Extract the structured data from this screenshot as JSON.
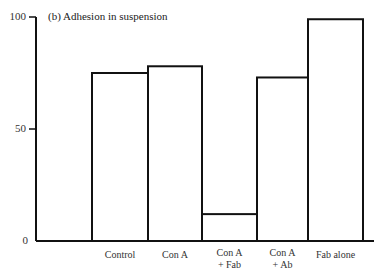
{
  "chart_data": {
    "type": "bar",
    "title": "(b)  Adhesion in suspension",
    "xlabel": "",
    "ylabel": "",
    "ylim": [
      0,
      100
    ],
    "yticks": [
      0,
      50,
      100
    ],
    "ytick_labels": [
      "0",
      "50",
      "100"
    ],
    "grid": false,
    "legend": null,
    "categories": [
      "Control",
      "Con A",
      "Con A + Fab",
      "Con A + Ab",
      "Fab alone"
    ],
    "category_label_lines": [
      [
        "Control"
      ],
      [
        "Con A"
      ],
      [
        "Con A",
        "+ Fab"
      ],
      [
        "Con A",
        "+ Ab"
      ],
      [
        "Fab alone"
      ]
    ],
    "values": [
      75,
      78,
      12,
      73,
      99
    ],
    "bar_style": "outline",
    "colors": {
      "stroke": "#111111",
      "fill": "#ffffff"
    }
  }
}
